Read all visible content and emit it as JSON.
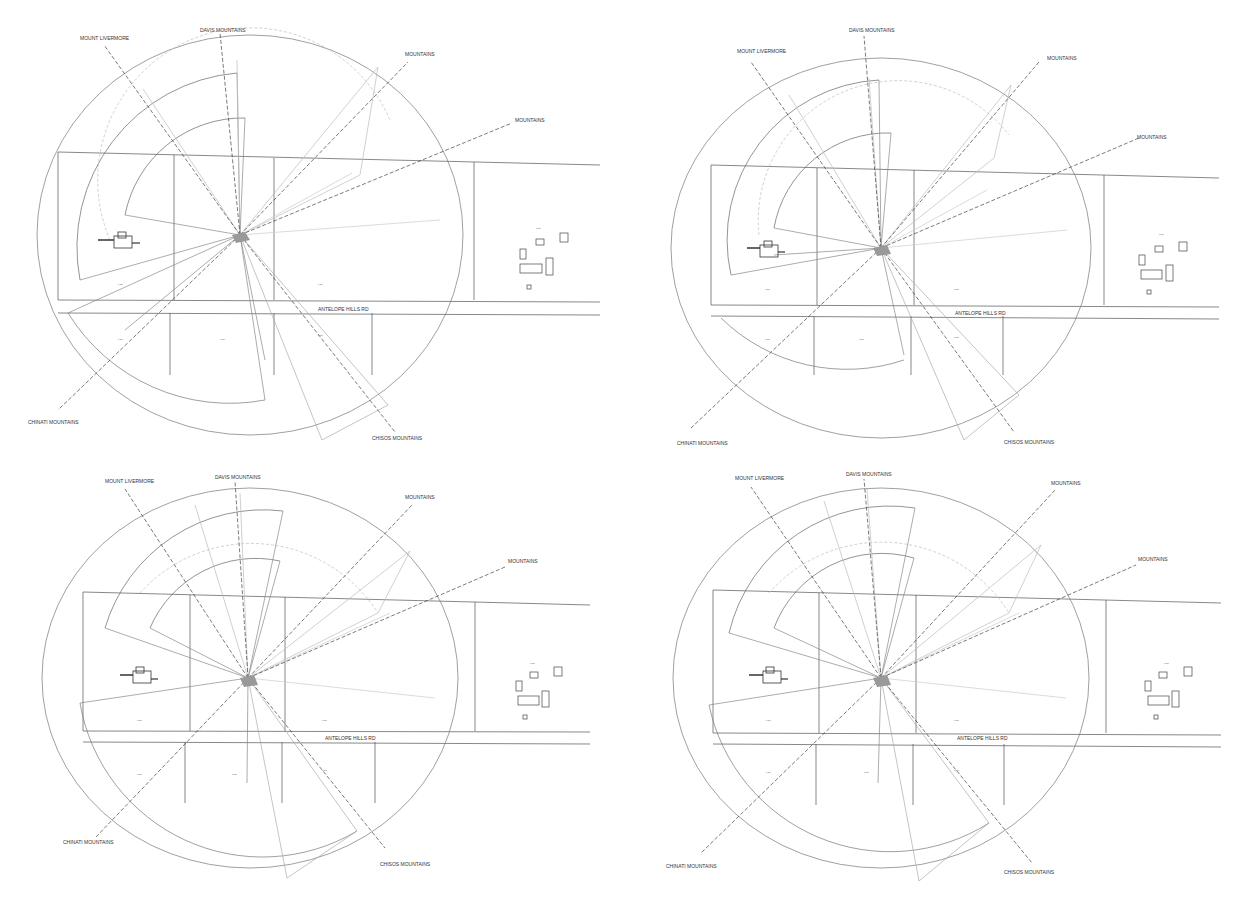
{
  "panels": [
    {
      "id": "top-left",
      "x": 0,
      "y": 0,
      "view_labels": {
        "mount_livermore": "MOUNT LIVERMORE",
        "davis": "DAVIS MOUNTAINS",
        "mountains_ne": "MOUNTAINS",
        "mountains_ene": "MOUNTAINS",
        "chinati": "CHINATI MOUNTAINS",
        "chisos": "CHISOS MOUNTAINS"
      },
      "road": "ANTELOPE HILLS RD"
    },
    {
      "id": "top-right",
      "x": 619,
      "y": 0,
      "view_labels": {
        "mount_livermore": "MOUNT LIVERMORE",
        "davis": "DAVIS MOUNTAINS",
        "mountains_ne": "MOUNTAINS",
        "mountains_ene": "MOUNTAINS",
        "chinati": "CHINATI MOUNTAINS",
        "chisos": "CHISOS MOUNTAINS"
      },
      "road": "ANTELOPE HILLS RD"
    },
    {
      "id": "bottom-left",
      "x": 0,
      "y": 453,
      "view_labels": {
        "mount_livermore": "MOUNT LIVERMORE",
        "davis": "DAVIS MOUNTAINS",
        "mountains_ne": "MOUNTAINS",
        "mountains_ene": "MOUNTAINS",
        "chinati": "CHINATI MOUNTAINS",
        "chisos": "CHISOS MOUNTAINS"
      },
      "road": "ANTELOPE HILLS RD"
    },
    {
      "id": "bottom-right",
      "x": 619,
      "y": 453,
      "view_labels": {
        "mount_livermore": "MOUNT LIVERMORE",
        "davis": "DAVIS MOUNTAINS",
        "mountains_ne": "MOUNTAINS",
        "mountains_ene": "MOUNTAINS",
        "chinati": "CHINATI MOUNTAINS",
        "chisos": "CHISOS MOUNTAINS"
      },
      "road": "ANTELOPE HILLS RD"
    }
  ],
  "colors": {
    "line": "#555555",
    "light": "#aaaaaa",
    "dash": "#222222"
  }
}
